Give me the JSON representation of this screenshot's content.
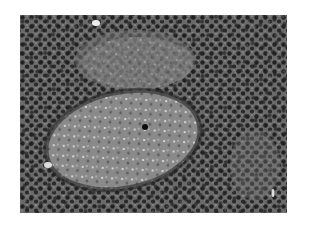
{
  "image": {
    "subject": "grayscale histology micrograph of lymphoid tissue",
    "features": [
      "densely packed dark lymphocyte nuclei",
      "oval pale germinal center follicle",
      "second fainter pale region upper center"
    ],
    "colors": {
      "background": "#ffffff",
      "tissue_base": "#5a5a5a",
      "nuclei": "#262626",
      "follicle": "#8a8a8a",
      "highlights": "#e6e6e6"
    }
  }
}
